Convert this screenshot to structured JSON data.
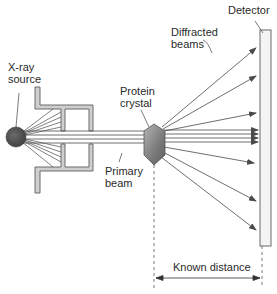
{
  "diagram": {
    "labels": {
      "xray_source": "X-ray\nsource",
      "protein_crystal": "Protein\ncrystal",
      "primary_beam": "Primary\nbeam",
      "diffracted_beams": "Diffracted\nbeams",
      "detector": "Detector",
      "known_distance": "Known distance"
    },
    "colors": {
      "line": "#4a4a4a",
      "collimator_fill": "#cfcfcf",
      "source_fill": "#555555",
      "crystal_fill": "#8a8a8a",
      "detector_fill": "#f4f4f4",
      "text": "#2a2a2a"
    }
  }
}
